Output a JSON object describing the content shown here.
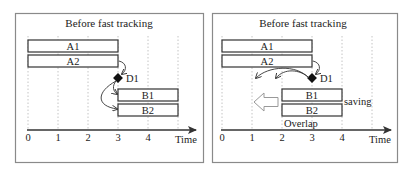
{
  "panels": [
    {
      "title": "Before fast tracking",
      "axis": {
        "label": "Time",
        "ticks": [
          "0",
          "1",
          "2",
          "3",
          "4"
        ]
      },
      "bars": [
        {
          "label": "A1",
          "start": 0,
          "end": 3
        },
        {
          "label": "A2",
          "start": 0,
          "end": 3
        },
        {
          "label": "B1",
          "start": 3,
          "end": 5
        },
        {
          "label": "B2",
          "start": 3,
          "end": 5
        }
      ],
      "decision": {
        "label": "D1",
        "time": 3
      }
    },
    {
      "title": "Before fast tracking",
      "axis": {
        "label": "Time",
        "ticks": [
          "0",
          "1",
          "2",
          "3",
          "4"
        ]
      },
      "bars": [
        {
          "label": "A1",
          "start": 0,
          "end": 3
        },
        {
          "label": "A2",
          "start": 0,
          "end": 3
        },
        {
          "label": "B1",
          "start": 2,
          "end": 4
        },
        {
          "label": "B2",
          "start": 2,
          "end": 4
        }
      ],
      "decision": {
        "label": "D1",
        "time": 3
      },
      "annotations": {
        "saving": "saving",
        "overlap": "Overlap"
      }
    }
  ]
}
